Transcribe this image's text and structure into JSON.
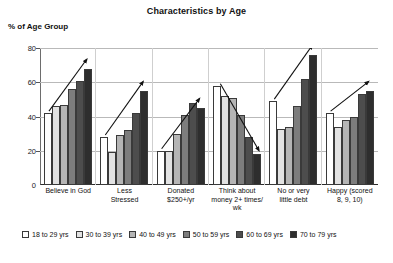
{
  "chart_data": {
    "type": "bar",
    "title": "Characteristics by Age",
    "ylabel": "% of Age Group",
    "xlabel": "",
    "ylim": [
      0,
      80
    ],
    "yticks": [
      0,
      20,
      40,
      60,
      80
    ],
    "grid": true,
    "legend_position": "bottom",
    "categories": [
      "Believe in God",
      "Less Stressed",
      "Donated $250+/yr",
      "Think about money 2+ times/ wk",
      "No or very little debt",
      "Happy (scored 8, 9, 10)"
    ],
    "series": [
      {
        "name": "18 to 29 yrs",
        "color": "#ffffff",
        "values": [
          42,
          28,
          20,
          58,
          49,
          42
        ]
      },
      {
        "name": "30 to 39 yrs",
        "color": "#e2e2e2",
        "values": [
          46,
          19,
          20,
          52,
          33,
          34
        ]
      },
      {
        "name": "40 to 49 yrs",
        "color": "#b5b5b5",
        "values": [
          47,
          29,
          30,
          51,
          34,
          38
        ]
      },
      {
        "name": "50 to 59 yrs",
        "color": "#7d7d7d",
        "values": [
          56,
          32,
          41,
          41,
          46,
          40
        ]
      },
      {
        "name": "60 to 69 yrs",
        "color": "#4d4d4d",
        "values": [
          61,
          42,
          48,
          28,
          62,
          53
        ]
      },
      {
        "name": "70 to 79 yrs",
        "color": "#2e2e2e",
        "values": [
          68,
          55,
          45,
          18,
          76,
          55
        ]
      }
    ],
    "annotations": [
      {
        "group": "Believe in God",
        "type": "trend-arrow",
        "direction": "up"
      },
      {
        "group": "Less Stressed",
        "type": "trend-arrow",
        "direction": "up"
      },
      {
        "group": "Donated $250+/yr",
        "type": "trend-arrow",
        "direction": "up"
      },
      {
        "group": "Think about money 2+ times/ wk",
        "type": "trend-arrow",
        "direction": "down"
      },
      {
        "group": "No or very little debt",
        "type": "trend-arrow",
        "direction": "up"
      },
      {
        "group": "Happy (scored 8, 9, 10)",
        "type": "trend-arrow",
        "direction": "up"
      }
    ]
  },
  "axis": {
    "tick_0": "0",
    "tick_1": "20",
    "tick_2": "40",
    "tick_3": "60",
    "tick_4": "80"
  },
  "xlabels": {
    "g0_l0": "Believe in God",
    "g0_l1": "",
    "g0_l2": "",
    "g1_l0": "Less",
    "g1_l1": "Stressed",
    "g1_l2": "",
    "g2_l0": "Donated",
    "g2_l1": "$250+/yr",
    "g2_l2": "",
    "g3_l0": "Think about",
    "g3_l1": "money 2+ times/",
    "g3_l2": "wk",
    "g4_l0": "No or very",
    "g4_l1": "little debt",
    "g4_l2": "",
    "g5_l0": "Happy (scored",
    "g5_l1": "8, 9, 10)",
    "g5_l2": ""
  },
  "legend": {
    "items": [
      {
        "label": "18 to 29 yrs"
      },
      {
        "label": "30 to 39 yrs"
      },
      {
        "label": "40 to 49 yrs"
      },
      {
        "label": "50 to 59 yrs"
      },
      {
        "label": "60 to 69 yrs"
      },
      {
        "label": "70 to 79 yrs"
      }
    ]
  }
}
